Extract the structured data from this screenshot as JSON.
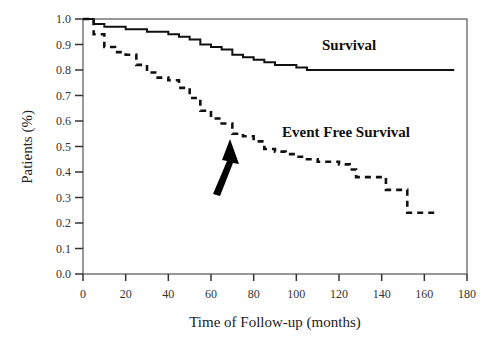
{
  "chart_data": {
    "type": "line",
    "title": "",
    "xlabel": "Time of Follow-up (months)",
    "ylabel": "Patients (%)",
    "xlim": [
      0,
      180
    ],
    "ylim": [
      0.0,
      1.0
    ],
    "x_ticks": [
      0,
      20,
      40,
      60,
      80,
      100,
      120,
      140,
      160,
      180
    ],
    "y_ticks": [
      "0.0",
      "0.1",
      "0.2",
      "0.3",
      "0.4",
      "0.5",
      "0.6",
      "0.7",
      "0.8",
      "0.9",
      "1.0"
    ],
    "grid": false,
    "legend": "inline labels",
    "series": [
      {
        "name": "Survival",
        "style": "solid",
        "x": [
          0,
          5,
          10,
          20,
          30,
          40,
          45,
          50,
          55,
          60,
          65,
          70,
          75,
          80,
          85,
          90,
          95,
          100,
          105,
          110,
          120,
          140,
          160,
          174
        ],
        "y": [
          1.0,
          0.98,
          0.97,
          0.96,
          0.95,
          0.94,
          0.93,
          0.92,
          0.9,
          0.89,
          0.88,
          0.86,
          0.85,
          0.84,
          0.83,
          0.82,
          0.82,
          0.81,
          0.8,
          0.8,
          0.8,
          0.8,
          0.8,
          0.8
        ]
      },
      {
        "name": "Event Free Survival",
        "style": "dashed",
        "x": [
          0,
          5,
          10,
          15,
          20,
          25,
          30,
          35,
          40,
          45,
          50,
          55,
          60,
          65,
          70,
          75,
          80,
          85,
          90,
          95,
          100,
          105,
          110,
          115,
          120,
          125,
          128,
          135,
          140,
          142,
          145,
          150,
          152,
          160,
          167
        ],
        "y": [
          1.0,
          0.94,
          0.89,
          0.87,
          0.86,
          0.82,
          0.79,
          0.77,
          0.76,
          0.73,
          0.69,
          0.64,
          0.61,
          0.59,
          0.55,
          0.54,
          0.52,
          0.49,
          0.48,
          0.47,
          0.46,
          0.45,
          0.44,
          0.44,
          0.43,
          0.41,
          0.38,
          0.38,
          0.38,
          0.33,
          0.33,
          0.33,
          0.24,
          0.24,
          0.24
        ]
      }
    ],
    "annotations": [
      {
        "type": "arrow",
        "points_to_x": 70,
        "points_to_y": 0.54,
        "label": ""
      },
      {
        "type": "text",
        "text": "Survival",
        "x": 130,
        "y": 0.89
      },
      {
        "type": "text",
        "text": "Event Free Survival",
        "x": 117,
        "y": 0.56
      }
    ]
  },
  "labels": {
    "xlabel": "Time of Follow-up (months)",
    "ylabel": "Patients (%)",
    "survival": "Survival",
    "efs": "Event Free Survival"
  }
}
